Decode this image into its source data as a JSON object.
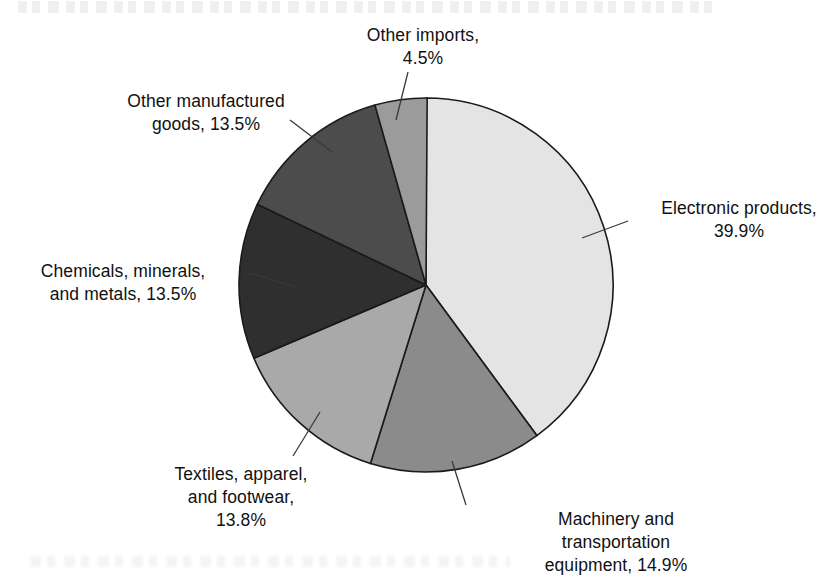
{
  "figure": {
    "name": "us-imports-from-china-pie-chart",
    "background_color": "#ffffff"
  },
  "chart_data": {
    "type": "pie",
    "title": "",
    "subtitle": "",
    "xlabel": "",
    "ylabel": "",
    "units": "percent",
    "start_angle_deg": 0,
    "direction": "clockwise",
    "legend": "none",
    "grid": false,
    "labels_on_slices": false,
    "label_style": "external labels with leader lines",
    "categories": [
      "Electronic products",
      "Machinery and transportation equipment",
      "Textiles, apparel, and footwear",
      "Chemicals, minerals, and metals",
      "Other manufactured goods",
      "Other imports"
    ],
    "values": [
      39.9,
      14.9,
      13.8,
      13.5,
      13.5,
      4.5
    ],
    "value_labels": [
      "39.9%",
      "14.9%",
      "13.8%",
      "13.5%",
      "13.5%",
      "4.5%"
    ],
    "colors": [
      "#e4e4e4",
      "#8b8b8b",
      "#a9a9a9",
      "#2f2f2f",
      "#4c4c4c",
      "#9b9b9b"
    ],
    "slices": [
      {
        "name": "electronic-products",
        "label": "Electronic products,",
        "label_line2": "39.9%",
        "label_full": "Electronic products, 39.9%",
        "value": 39.9,
        "percent_text": "39.9%",
        "color": "#e4e4e4",
        "start_deg": 0.0,
        "sweep_deg": 143.64
      },
      {
        "name": "machinery-and-transportation-equipment",
        "label": "Machinery and",
        "label_line2": "transportation",
        "label_line3": "equipment, 14.9%",
        "label_full": "Machinery and transportation equipment, 14.9%",
        "value": 14.9,
        "percent_text": "14.9%",
        "color": "#8b8b8b",
        "start_deg": 143.64,
        "sweep_deg": 53.64
      },
      {
        "name": "textiles-apparel-and-footwear",
        "label": "Textiles, apparel,",
        "label_line2": "and footwear,",
        "label_line3": "13.8%",
        "label_full": "Textiles, apparel, and footwear, 13.8%",
        "value": 13.8,
        "percent_text": "13.8%",
        "color": "#a9a9a9",
        "start_deg": 197.28,
        "sweep_deg": 49.68
      },
      {
        "name": "chemicals-minerals-and-metals",
        "label": "Chemicals, minerals,",
        "label_line2": "and metals, 13.5%",
        "label_full": "Chemicals, minerals, and metals, 13.5%",
        "value": 13.5,
        "percent_text": "13.5%",
        "color": "#2f2f2f",
        "start_deg": 246.96,
        "sweep_deg": 48.6
      },
      {
        "name": "other-manufactured-goods",
        "label": "Other manufactured",
        "label_line2": "goods, 13.5%",
        "label_full": "Other manufactured goods, 13.5%",
        "value": 13.5,
        "percent_text": "13.5%",
        "color": "#4c4c4c",
        "start_deg": 295.56,
        "sweep_deg": 48.6
      },
      {
        "name": "other-imports",
        "label": "Other imports,",
        "label_line2": "4.5%",
        "label_full": "Other imports, 4.5%",
        "value": 4.5,
        "percent_text": "4.5%",
        "color": "#9b9b9b",
        "start_deg": 344.16,
        "sweep_deg": 16.2
      }
    ]
  },
  "labels": {
    "other_imports": "Other imports,\n4.5%",
    "other_manufactured": "Other manufactured\ngoods, 13.5%",
    "chemicals": "Chemicals, minerals,\nand metals, 13.5%",
    "textiles": "Textiles, apparel,\nand footwear,\n13.8%",
    "machinery": "Machinery and\ntransportation\nequipment, 14.9%",
    "electronic": "Electronic products,\n39.9%"
  }
}
